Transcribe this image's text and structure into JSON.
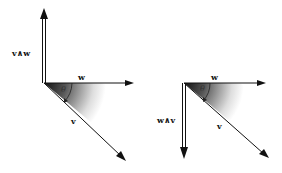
{
  "diagram": {
    "left": {
      "vector_w_label": "w",
      "vector_v_label": "v",
      "wedge_label": "v∧w",
      "angle_label": "θ",
      "wedge_direction": "up"
    },
    "right": {
      "vector_w_label": "w",
      "vector_v_label": "v",
      "wedge_label": "w∧v",
      "angle_label": "θ",
      "wedge_direction": "down"
    },
    "colors": {
      "line": "#111111",
      "shade_dark": "#1a1a1a",
      "shade_light": "#ffffff"
    }
  }
}
